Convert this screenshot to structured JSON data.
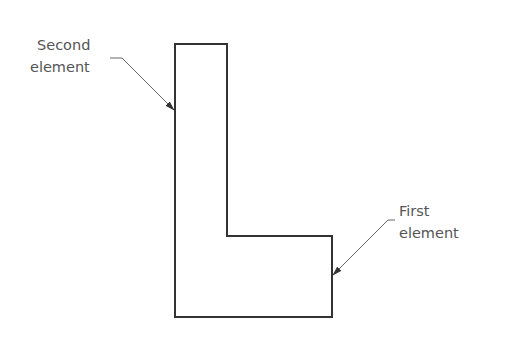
{
  "diagram": {
    "shape": "L-shaped outline",
    "labels": [
      {
        "id": "second",
        "lines": [
          "Second",
          "element"
        ]
      },
      {
        "id": "first",
        "lines": [
          "First",
          "element"
        ]
      }
    ],
    "colors": {
      "outline": "#333333",
      "leader": "#666666",
      "text": "#555555"
    }
  }
}
